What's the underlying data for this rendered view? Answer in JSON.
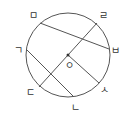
{
  "diagram": {
    "center_label": "ㅇ",
    "points": {
      "giyeok": "ㄱ",
      "nieun": "ㄴ",
      "digeut": "ㄷ",
      "rieul": "ㄹ",
      "mieum": "ㅁ",
      "bieup": "ㅂ",
      "siot": "ㅅ"
    },
    "stroke_color": "#555555"
  }
}
